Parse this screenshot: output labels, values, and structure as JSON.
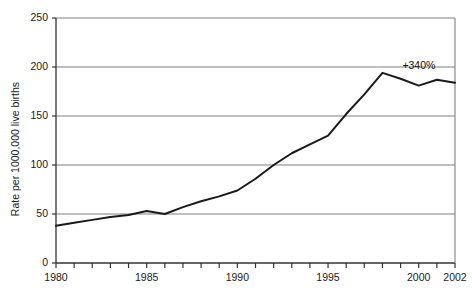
{
  "chart_data": {
    "type": "line",
    "title": "",
    "subtitle": "",
    "xlabel": "",
    "ylabel": "Rate per 1000,000 live births",
    "xlim": [
      1980,
      2002
    ],
    "ylim": [
      0,
      250
    ],
    "grid": true,
    "grid_axis": "y",
    "legend": false,
    "legend_position": "none",
    "x_tick_labels": [
      "1980",
      "1985",
      "1990",
      "1995",
      "2000",
      "2002"
    ],
    "x_tick_values": [
      1980,
      1985,
      1990,
      1995,
      2000,
      2002
    ],
    "x_minor_ticks_every": 1,
    "y_tick_labels": [
      "0",
      "50",
      "100",
      "150",
      "200",
      "250"
    ],
    "y_tick_values": [
      0,
      50,
      100,
      150,
      200,
      250
    ],
    "x": [
      1980,
      1981,
      1982,
      1983,
      1984,
      1985,
      1986,
      1987,
      1988,
      1989,
      1990,
      1991,
      1992,
      1993,
      1994,
      1995,
      1996,
      1997,
      1998,
      1999,
      2000,
      2001,
      2002
    ],
    "series": [
      {
        "name": "Rate per 1000,000 live births",
        "color": "#1a1a1a",
        "values": [
          38,
          41,
          44,
          47,
          49,
          53,
          50,
          57,
          63,
          68,
          74,
          86,
          100,
          112,
          121,
          130,
          152,
          172,
          194,
          188,
          181,
          187,
          184
        ]
      }
    ],
    "annotations": [
      {
        "text": "+340%",
        "x": 1999.1,
        "y": 201,
        "name": "percent-change-annotation"
      }
    ],
    "axis_color": "#333333",
    "grid_color": "#808080",
    "line_color": "#1a1a1a",
    "background": "#ffffff"
  }
}
